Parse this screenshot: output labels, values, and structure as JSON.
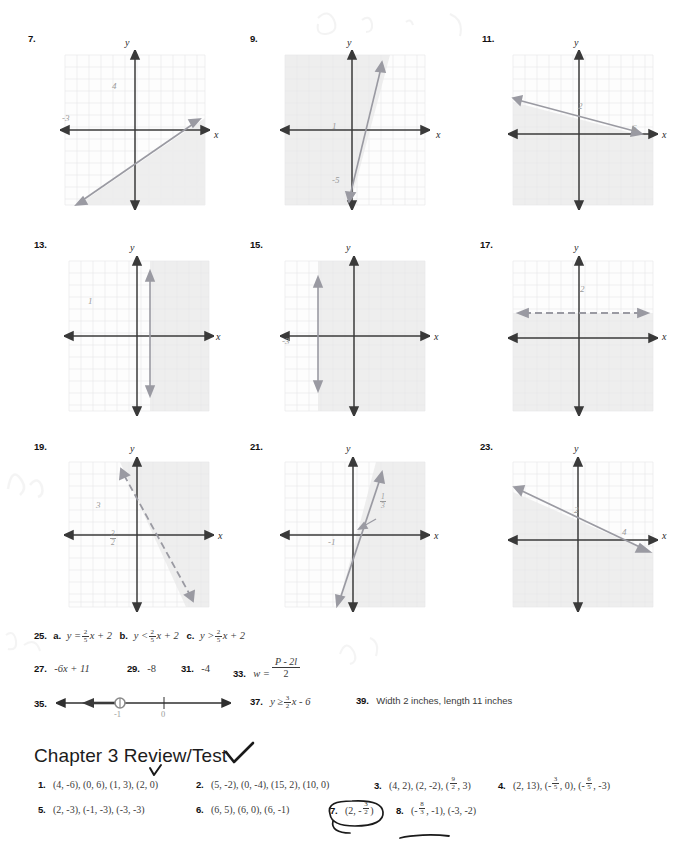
{
  "page": {
    "chapter_heading": "Chapter 3 Review/Test"
  },
  "graphs": [
    {
      "number": "7.",
      "x_label": "x",
      "y_label": "y",
      "line_style": "solid",
      "intercept_labels": [
        {
          "text": "4",
          "x": 112,
          "y": 56
        },
        {
          "text": "-3",
          "x": 62,
          "y": 88
        }
      ],
      "shading": "below-right",
      "description": "solid line through x-intercept near -3 rising to the right, region below shaded"
    },
    {
      "number": "9.",
      "x_label": "x",
      "y_label": "y",
      "line_style": "solid",
      "intercept_labels": [
        {
          "text": "1",
          "x": 92,
          "y": 95
        },
        {
          "text": "-5",
          "x": 92,
          "y": 148
        }
      ],
      "shading": "left",
      "description": "steep solid line crossing y at -5, region to the left shaded"
    },
    {
      "number": "11.",
      "x_label": "x",
      "y_label": "y",
      "line_style": "solid",
      "intercept_labels": [
        {
          "text": "2",
          "x": 82,
          "y": 60
        },
        {
          "text": "6",
          "x": 122,
          "y": 82
        }
      ],
      "shading": "below",
      "description": "solid line from y-intercept 2 down to x-intercept 6, region below shaded"
    },
    {
      "number": "13.",
      "x_label": "x",
      "y_label": "y",
      "line_style": "solid",
      "intercept_labels": [
        {
          "text": "1",
          "x": 82,
          "y": 62
        }
      ],
      "shading": "right",
      "description": "solid vertical line at x = 1, region to the right shaded"
    },
    {
      "number": "15.",
      "x_label": "x",
      "y_label": "y",
      "line_style": "solid",
      "intercept_labels": [
        {
          "text": "-3",
          "x": 48,
          "y": 82
        }
      ],
      "shading": "right",
      "description": "solid vertical line at x = -3, region to the right shaded"
    },
    {
      "number": "17.",
      "x_label": "x",
      "y_label": "y",
      "line_style": "dashed",
      "intercept_labels": [
        {
          "text": "2",
          "x": 81,
          "y": 50
        }
      ],
      "shading": "below",
      "description": "dashed horizontal line at y = 2, region below shaded"
    },
    {
      "number": "19.",
      "x_label": "x",
      "y_label": "y",
      "line_style": "dashed",
      "intercept_labels": [
        {
          "text": "3",
          "x": 62,
          "y": 48
        },
        {
          "text": "3/2",
          "num": "3",
          "den": "2",
          "x": 84,
          "y": 82
        }
      ],
      "shading": "right",
      "description": "dashed line through (0,3) and (3/2,0), region to the right shaded"
    },
    {
      "number": "21.",
      "x_label": "x",
      "y_label": "y",
      "line_style": "solid",
      "intercept_labels": [
        {
          "text": "1/3",
          "num": "1",
          "den": "3",
          "x": 100,
          "y": 58
        },
        {
          "text": "-1",
          "x": 62,
          "y": 82
        }
      ],
      "shading": "right",
      "description": "steep solid line through (0,-1), region to the right shaded"
    },
    {
      "number": "23.",
      "x_label": "x",
      "y_label": "y",
      "line_style": "solid",
      "intercept_labels": [
        {
          "text": "2",
          "x": 80,
          "y": 56
        },
        {
          "text": "4",
          "x": 110,
          "y": 78
        }
      ],
      "shading": "below",
      "description": "solid line through (0,2) and (4,0), region below shaded"
    }
  ],
  "answers": {
    "item25": {
      "number": "25.",
      "part_a_label": "a.",
      "part_a": {
        "lhs": "y =",
        "num": "2",
        "den": "5",
        "rhs": "x + 2"
      },
      "part_b_label": "b.",
      "part_b": {
        "lhs": "y <",
        "num": "2",
        "den": "5",
        "rhs": "x + 2"
      },
      "part_c_label": "c.",
      "part_c": {
        "lhs": "y >",
        "num": "2",
        "den": "5",
        "rhs": "x + 2"
      }
    },
    "item27": {
      "number": "27.",
      "value": "-6x + 11"
    },
    "item29": {
      "number": "29.",
      "value": "-8"
    },
    "item31": {
      "number": "31.",
      "value": "-4"
    },
    "item33": {
      "number": "33.",
      "lhs": "w =",
      "num": "P - 2l",
      "den": "2"
    },
    "item35": {
      "number": "35.",
      "tick_labels": [
        "-1",
        "0"
      ],
      "description": "number line with closed-open circle at -1 and ray shaded to the left"
    },
    "item37": {
      "number": "37.",
      "lhs": "y ≥",
      "num": "3",
      "den": "2",
      "rhs": "x - 6"
    },
    "item39": {
      "number": "39.",
      "value": "Width 2 inches, length 11 inches"
    }
  },
  "review_answers": {
    "row1": [
      {
        "number": "1.",
        "value": "(4, -6), (0, 6), (1, 3), (2, 0)"
      },
      {
        "number": "2.",
        "value": "(5, -2), (0, -4), (15, 2), (10, 0)"
      },
      {
        "number": "3.",
        "prefix": "(4, 2), (2, -2), (",
        "num": "9",
        "den": "2",
        "suffix": ", 3)"
      },
      {
        "number": "4.",
        "prefix": "(2, 13), (-",
        "num": "3",
        "den": "5",
        "mid": ", 0), (-",
        "num2": "6",
        "den2": "5",
        "suffix": ", -3)"
      }
    ],
    "row2": [
      {
        "number": "5.",
        "value": "(2, -3), (-1, -3), (-3, -3)"
      },
      {
        "number": "6.",
        "value": "(6, 5), (6, 0), (6, -1)"
      },
      {
        "number": "7.",
        "prefix": "(2, -",
        "num": "3",
        "den": "2",
        "suffix": ")",
        "annotated": "circled"
      },
      {
        "number": "8.",
        "prefix": "(-",
        "num": "8",
        "den": "3",
        "suffix": ", -1), (-3, -2)",
        "annotated": "underlined"
      }
    ]
  },
  "ink_annotations": [
    {
      "name": "checkmark-chapter-title",
      "kind": "checkmark"
    },
    {
      "name": "checkmark-under-title",
      "kind": "checkmark-small"
    },
    {
      "name": "circle-item-7",
      "kind": "ellipse"
    },
    {
      "name": "underline-item-8",
      "kind": "underline"
    }
  ],
  "colors": {
    "grid_line": "#e3e3e6",
    "grid_major": "#d5d5da",
    "axis": "#3a3a3a",
    "plot_line": "#8e8e96",
    "shade": "#ececec",
    "label_gray": "#9a9a9a",
    "text": "#3a3a3a"
  }
}
